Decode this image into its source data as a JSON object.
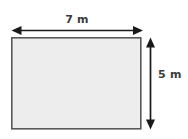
{
  "figure": {
    "type": "geometry-diagram",
    "shape_name": "rectangle",
    "background_color": "#ffffff",
    "shape": {
      "fill_color": "#ededed",
      "stroke_color": "#595959",
      "stroke_width": 1.6,
      "x": 11,
      "y": 37,
      "width": 130,
      "height": 92
    },
    "dimensions": [
      {
        "id": "width",
        "label": "7 m",
        "value": 7,
        "unit": "m",
        "orientation": "horizontal",
        "position": "top",
        "arrow_style": "double-headed",
        "color": "#1a1a1a"
      },
      {
        "id": "height",
        "label": "5 m",
        "value": 5,
        "unit": "m",
        "orientation": "vertical",
        "position": "right",
        "arrow_style": "double-headed",
        "color": "#1a1a1a"
      }
    ]
  }
}
